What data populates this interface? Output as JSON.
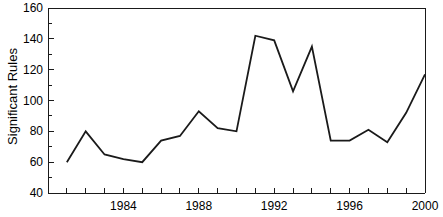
{
  "chart_data": {
    "type": "line",
    "title": "",
    "xlabel": "",
    "ylabel": "Significant Rules",
    "x": [
      1981,
      1982,
      1983,
      1984,
      1985,
      1986,
      1987,
      1988,
      1989,
      1990,
      1991,
      1992,
      1993,
      1994,
      1995,
      1996,
      1997,
      1998,
      1999,
      2000
    ],
    "values": [
      60,
      80,
      65,
      62,
      60,
      74,
      77,
      93,
      82,
      80,
      142,
      139,
      106,
      135,
      74,
      74,
      81,
      73,
      92,
      117
    ],
    "series": [
      {
        "name": "Significant Rules",
        "values": [
          60,
          80,
          65,
          62,
          60,
          74,
          77,
          93,
          82,
          80,
          142,
          139,
          106,
          135,
          74,
          74,
          81,
          73,
          92,
          117
        ]
      }
    ],
    "xlim": [
      1980,
      2000
    ],
    "ylim": [
      40,
      160
    ],
    "y_ticks_major": [
      40,
      60,
      80,
      100,
      120,
      140,
      160
    ],
    "y_ticks_minor": [
      50,
      70,
      90,
      110,
      130,
      150
    ],
    "y_tick_labels": [
      "40",
      "60",
      "80",
      "100",
      "120",
      "140",
      "160"
    ],
    "x_ticks_major": [
      1984,
      1988,
      1992,
      1996,
      2000
    ],
    "x_tick_labels": [
      "1984",
      "1988",
      "1992",
      "1996",
      "2000"
    ],
    "x_ticks_minor": [
      1981,
      1982,
      1983,
      1985,
      1986,
      1987,
      1989,
      1990,
      1991,
      1993,
      1994,
      1995,
      1997,
      1998,
      1999
    ],
    "grid": false,
    "legend": false,
    "line_color": "#1a1a1a",
    "axis_color": "#1a1a1a",
    "background_color": "#ffffff"
  }
}
